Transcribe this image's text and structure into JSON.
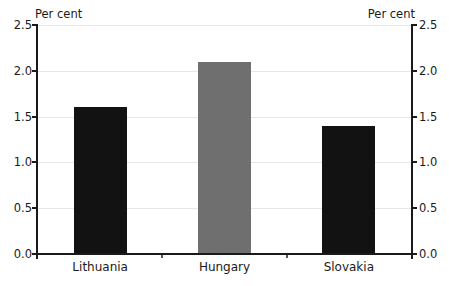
{
  "chart_data": {
    "type": "bar",
    "title": "",
    "categories": [
      "Lithuania",
      "Hungary",
      "Slovakia"
    ],
    "values": [
      1.6,
      2.1,
      1.4
    ],
    "bar_colors": [
      "#121212",
      "#6f6f6f",
      "#121212"
    ],
    "ylabel_left": "Per cent",
    "ylabel_right": "Per cent",
    "xlabel": "",
    "ylim": [
      0,
      2.5
    ],
    "yticks": [
      0.0,
      0.5,
      1.0,
      1.5,
      2.0,
      2.5
    ],
    "ytick_labels": [
      "0.0",
      "0.5",
      "1.0",
      "1.5",
      "2.0",
      "2.5"
    ],
    "grid": true,
    "legend": "none",
    "dual_axis": true
  },
  "colors": {
    "axis": "#1a1a1a",
    "gridline": "#e6e6e6",
    "background": "#ffffff",
    "text": "#1a1a1a",
    "bar_dark": "#121212",
    "bar_gray": "#6f6f6f"
  }
}
